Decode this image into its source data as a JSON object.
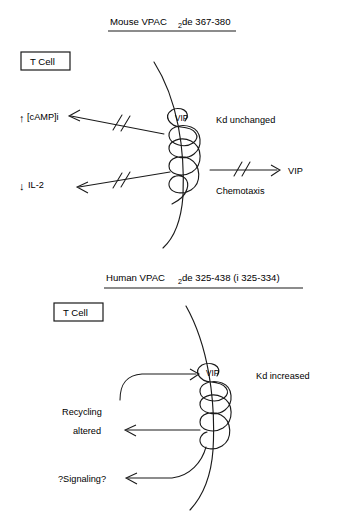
{
  "figure": {
    "type": "biological-signaling-diagram",
    "background_color": "#ffffff",
    "stroke_color": "#1a1a1a",
    "panel_count": 2
  },
  "panel_top": {
    "title": {
      "prefix": "Mouse VPAC",
      "subscript": "2",
      "suffix": " de 367-380",
      "underlined": true
    },
    "cell_box_label": "T Cell",
    "receptor_ligand_label": "VIP",
    "left_outputs": [
      {
        "arrow_glyph": "↑",
        "label": "[cAMP]i",
        "blocked": true
      },
      {
        "arrow_glyph": "↓",
        "label": "IL-2",
        "blocked": true
      }
    ],
    "right_annotations": [
      {
        "label": "Kd unchanged"
      },
      {
        "label": "Chemotaxis"
      }
    ],
    "right_arrow": {
      "label": "VIP",
      "blocked": true
    }
  },
  "panel_bottom": {
    "title": {
      "prefix": "Human VPAC",
      "subscript": "2",
      "suffix": " de 325-438 (i 325-334)",
      "underlined": true
    },
    "cell_box_label": "T Cell",
    "receptor_ligand_label": "VIP",
    "left_outputs": [
      {
        "label_line1": "Recycling",
        "label_line2": "altered",
        "blocked": false
      },
      {
        "label_line1": "?Signaling?",
        "label_line2": "",
        "blocked": false
      }
    ],
    "right_annotations": [
      {
        "label": "Kd increased"
      }
    ]
  }
}
